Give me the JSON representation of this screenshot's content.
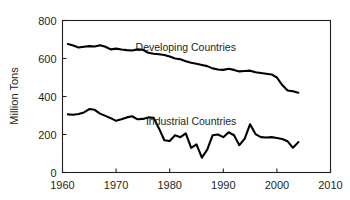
{
  "chart_data": {
    "type": "line",
    "title": "",
    "subtitle": "",
    "xlabel": "",
    "ylabel": "Million Tons",
    "xlim": [
      1960,
      2010
    ],
    "ylim": [
      0,
      800
    ],
    "xticks": [
      "1960",
      "1970",
      "1980",
      "1990",
      "2000",
      "2010"
    ],
    "xtick_values": [
      1960,
      1970,
      1980,
      1990,
      2000,
      2010
    ],
    "yticks": [
      "0",
      "200",
      "400",
      "600",
      "800"
    ],
    "ytick_values": [
      0,
      200,
      400,
      600,
      800
    ],
    "grid": false,
    "legend_position": "inline-annotation",
    "x": [
      1961,
      1962,
      1963,
      1964,
      1965,
      1966,
      1967,
      1968,
      1969,
      1970,
      1971,
      1972,
      1973,
      1974,
      1975,
      1976,
      1977,
      1978,
      1979,
      1980,
      1981,
      1982,
      1983,
      1984,
      1985,
      1986,
      1987,
      1988,
      1989,
      1990,
      1991,
      1992,
      1993,
      1994,
      1995,
      1996,
      1997,
      1998,
      1999,
      2000,
      2001,
      2002,
      2003,
      2004
    ],
    "series": [
      {
        "name": "Developing Countries",
        "color": "#000000",
        "label_x": 1983,
        "label_y": 640,
        "values": [
          676,
          668,
          658,
          662,
          665,
          663,
          670,
          662,
          648,
          652,
          647,
          644,
          642,
          648,
          646,
          630,
          625,
          622,
          618,
          610,
          600,
          596,
          586,
          578,
          572,
          566,
          560,
          548,
          542,
          540,
          546,
          540,
          532,
          534,
          536,
          528,
          524,
          520,
          516,
          500,
          460,
          432,
          428,
          420
        ]
      },
      {
        "name": "Industrial Countries",
        "color": "#000000",
        "label_x": 1984,
        "label_y": 252,
        "values": [
          306,
          304,
          308,
          316,
          334,
          330,
          310,
          298,
          286,
          272,
          280,
          290,
          296,
          280,
          282,
          290,
          288,
          232,
          170,
          166,
          196,
          186,
          206,
          130,
          148,
          78,
          120,
          196,
          200,
          186,
          212,
          196,
          144,
          178,
          254,
          202,
          186,
          184,
          186,
          182,
          176,
          164,
          130,
          160
        ]
      }
    ],
    "annotations": [
      {
        "text": "Developing Countries",
        "x": 1983,
        "y": 640
      },
      {
        "text": "Industrial Countries",
        "x": 1984,
        "y": 252
      }
    ]
  }
}
